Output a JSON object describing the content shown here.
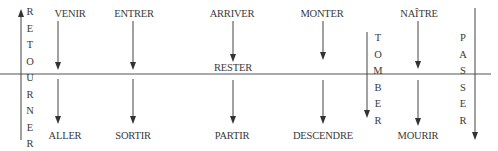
{
  "diagram": {
    "type": "french-verb-motion-diagram",
    "center_line_label": "RESTER",
    "top_verbs": [
      {
        "label": "VENIR",
        "x": 70
      },
      {
        "label": "ENTRER",
        "x": 133
      },
      {
        "label": "ARRIVER",
        "x": 232
      },
      {
        "label": "MONTER",
        "x": 322
      },
      {
        "label": "NAÎTRE",
        "x": 418
      }
    ],
    "bottom_verbs": [
      {
        "label": "ALLER",
        "x": 70
      },
      {
        "label": "SORTIR",
        "x": 133
      },
      {
        "label": "PARTIR",
        "x": 232
      },
      {
        "label": "DESCENDRE",
        "x": 322
      },
      {
        "label": "MOURIR",
        "x": 418
      }
    ],
    "vertical_words": [
      {
        "word": "RETOURNER",
        "letters": [
          "R",
          "E",
          "T",
          "O",
          "U",
          "R",
          "N",
          "E",
          "R"
        ],
        "direction": "up"
      },
      {
        "word": "TOMBER",
        "letters": [
          "T",
          "O",
          "M",
          "B",
          "E",
          "R"
        ],
        "direction": "down"
      },
      {
        "word": "PASSER",
        "letters": [
          "P",
          "A",
          "S",
          "S",
          "E",
          "R"
        ],
        "direction": "down"
      }
    ]
  }
}
